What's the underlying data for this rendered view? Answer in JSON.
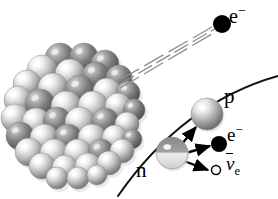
{
  "figure": {
    "kind": "beta-decay-diagram",
    "background_color": "#ffffff",
    "width": 278,
    "height": 199
  },
  "labels": {
    "electron_emitted": {
      "base": "e",
      "sup": "−"
    },
    "proton": "p",
    "neutron": "n",
    "electron_inset": {
      "base": "e",
      "sup": "−"
    },
    "antineutrino": {
      "base": "ν",
      "sub": "e"
    }
  },
  "colors": {
    "ink": "#000000",
    "nucleon_light": "#f2f2f2",
    "nucleon_mid": "#9a9a9a",
    "nucleon_dark": "#6b6b6b",
    "nucleon_shadow": "#d9d9d9",
    "track": "#8c8c8c",
    "arc": "#111111"
  },
  "nucleus": {
    "name": "atomic-nucleus-cluster",
    "center": [
      74,
      117
    ],
    "radius": 66,
    "nucleon_count": 52,
    "nucleons": [
      {
        "x": 60,
        "y": 58,
        "r": 15,
        "tone": "dark"
      },
      {
        "x": 84,
        "y": 57,
        "r": 14,
        "tone": "dark"
      },
      {
        "x": 105,
        "y": 64,
        "r": 14,
        "tone": "dark"
      },
      {
        "x": 42,
        "y": 70,
        "r": 15,
        "tone": "light"
      },
      {
        "x": 70,
        "y": 74,
        "r": 15,
        "tone": "light"
      },
      {
        "x": 96,
        "y": 76,
        "r": 14,
        "tone": "dark"
      },
      {
        "x": 119,
        "y": 78,
        "r": 13,
        "tone": "dark"
      },
      {
        "x": 27,
        "y": 84,
        "r": 14,
        "tone": "light"
      },
      {
        "x": 53,
        "y": 88,
        "r": 15,
        "tone": "light"
      },
      {
        "x": 80,
        "y": 90,
        "r": 15,
        "tone": "dark"
      },
      {
        "x": 107,
        "y": 92,
        "r": 14,
        "tone": "light"
      },
      {
        "x": 128,
        "y": 93,
        "r": 12,
        "tone": "dark"
      },
      {
        "x": 18,
        "y": 100,
        "r": 14,
        "tone": "light"
      },
      {
        "x": 40,
        "y": 104,
        "r": 15,
        "tone": "dark"
      },
      {
        "x": 66,
        "y": 106,
        "r": 15,
        "tone": "light"
      },
      {
        "x": 93,
        "y": 106,
        "r": 15,
        "tone": "light"
      },
      {
        "x": 118,
        "y": 106,
        "r": 13,
        "tone": "light"
      },
      {
        "x": 134,
        "y": 110,
        "r": 11,
        "tone": "dark"
      },
      {
        "x": 15,
        "y": 118,
        "r": 14,
        "tone": "light"
      },
      {
        "x": 36,
        "y": 122,
        "r": 14,
        "tone": "light"
      },
      {
        "x": 57,
        "y": 121,
        "r": 14,
        "tone": "dark"
      },
      {
        "x": 80,
        "y": 122,
        "r": 15,
        "tone": "light"
      },
      {
        "x": 105,
        "y": 122,
        "r": 14,
        "tone": "dark"
      },
      {
        "x": 127,
        "y": 124,
        "r": 12,
        "tone": "light"
      },
      {
        "x": 20,
        "y": 136,
        "r": 14,
        "tone": "dark"
      },
      {
        "x": 44,
        "y": 138,
        "r": 14,
        "tone": "light"
      },
      {
        "x": 68,
        "y": 138,
        "r": 14,
        "tone": "dark"
      },
      {
        "x": 92,
        "y": 138,
        "r": 14,
        "tone": "light"
      },
      {
        "x": 115,
        "y": 138,
        "r": 13,
        "tone": "light"
      },
      {
        "x": 132,
        "y": 139,
        "r": 10,
        "tone": "dark"
      },
      {
        "x": 29,
        "y": 152,
        "r": 14,
        "tone": "light"
      },
      {
        "x": 54,
        "y": 153,
        "r": 14,
        "tone": "light"
      },
      {
        "x": 78,
        "y": 153,
        "r": 14,
        "tone": "light"
      },
      {
        "x": 101,
        "y": 152,
        "r": 13,
        "tone": "dark"
      },
      {
        "x": 122,
        "y": 151,
        "r": 12,
        "tone": "light"
      },
      {
        "x": 42,
        "y": 166,
        "r": 13,
        "tone": "light"
      },
      {
        "x": 65,
        "y": 168,
        "r": 13,
        "tone": "light"
      },
      {
        "x": 88,
        "y": 166,
        "r": 13,
        "tone": "light"
      },
      {
        "x": 109,
        "y": 163,
        "r": 12,
        "tone": "light"
      },
      {
        "x": 57,
        "y": 178,
        "r": 11,
        "tone": "light"
      },
      {
        "x": 78,
        "y": 178,
        "r": 11,
        "tone": "light"
      },
      {
        "x": 97,
        "y": 175,
        "r": 10,
        "tone": "light"
      }
    ]
  },
  "electron_track": {
    "name": "emitted-electron-track",
    "from": [
      120,
      84
    ],
    "to": [
      218,
      27
    ],
    "line_count": 3
  },
  "emitted_electron_dot": {
    "cx": 222,
    "cy": 24,
    "r": 9
  },
  "inset": {
    "name": "magnified-decay-inset",
    "arc": {
      "d": "M 118 196 C 150 150 200 98 278 76",
      "stroke_width": 2
    },
    "neutron": {
      "cx": 172,
      "cy": 153,
      "r": 16
    },
    "proton": {
      "cx": 207,
      "cy": 114,
      "r": 16
    },
    "electron": {
      "cx": 219,
      "cy": 144,
      "r": 8
    },
    "antineutrino": {
      "cx": 216,
      "cy": 170,
      "r": 4.5
    },
    "arrows": [
      {
        "name": "arrow-to-proton",
        "x1": 181,
        "y1": 145,
        "x2": 196,
        "y2": 127
      },
      {
        "name": "arrow-to-electron",
        "x1": 186,
        "y1": 153,
        "x2": 210,
        "y2": 146
      },
      {
        "name": "arrow-to-antineutrino",
        "x1": 184,
        "y1": 161,
        "x2": 208,
        "y2": 170
      }
    ]
  }
}
